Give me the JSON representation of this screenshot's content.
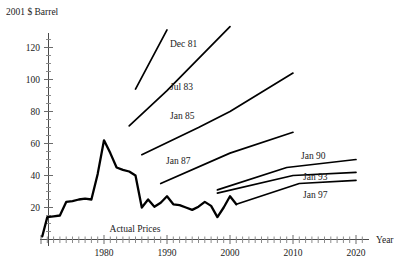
{
  "chart_data": {
    "type": "line",
    "title": "",
    "ylabel": "2001 $ Barrel",
    "xlabel": "Year",
    "xlim": [
      1970,
      2022
    ],
    "ylim": [
      0,
      133
    ],
    "grid": false,
    "legend": "inline-annotations",
    "y_ticks": [
      20,
      40,
      60,
      80,
      100,
      120
    ],
    "x_ticks": [
      1980,
      1990,
      2000,
      2010,
      2020
    ],
    "x_minor_tick_step": 1,
    "series": [
      {
        "name": "Actual Prices",
        "label": "Actual Prices",
        "kind": "history",
        "x": [
          1970.2,
          1971,
          1972,
          1973,
          1974,
          1975,
          1976,
          1977,
          1978,
          1979,
          1980,
          1981,
          1982,
          1983,
          1984,
          1985,
          1986,
          1987,
          1988,
          1989,
          1990,
          1991,
          1992,
          1993,
          1994,
          1995,
          1996,
          1997,
          1998,
          1999,
          2000,
          2001
        ],
        "y": [
          2,
          14,
          14.5,
          15,
          23.5,
          24,
          25,
          25.5,
          25,
          41,
          62,
          54,
          45,
          43.5,
          42.5,
          40,
          20,
          25,
          20.5,
          23,
          27,
          22,
          21.5,
          20,
          18.5,
          20.5,
          23.5,
          21,
          14,
          20,
          27,
          22
        ]
      },
      {
        "name": "Dec 81",
        "label": "Dec  81",
        "kind": "forecast",
        "x": [
          1985,
          1990
        ],
        "y": [
          94,
          131
        ]
      },
      {
        "name": "Jul 83",
        "label": "Jul  83",
        "kind": "forecast",
        "x": [
          1984,
          1990,
          2000
        ],
        "y": [
          71,
          93,
          133
        ]
      },
      {
        "name": "Jan 85",
        "label": "Jan  85",
        "kind": "forecast",
        "x": [
          1986,
          1995,
          2000,
          2010
        ],
        "y": [
          53,
          70,
          80,
          104
        ]
      },
      {
        "name": "Jan 87",
        "label": "Jan  87",
        "kind": "forecast",
        "x": [
          1989,
          2000,
          2010
        ],
        "y": [
          35,
          54,
          67
        ]
      },
      {
        "name": "Jan 90",
        "label": "Jan  90",
        "kind": "forecast",
        "x": [
          1998,
          2009,
          2020
        ],
        "y": [
          31,
          45,
          50
        ]
      },
      {
        "name": "Jan 93",
        "label": "Jan  93",
        "kind": "forecast",
        "x": [
          1998,
          2010,
          2020
        ],
        "y": [
          29,
          40,
          42
        ]
      },
      {
        "name": "Jan 97",
        "label": "Jan  97",
        "kind": "forecast",
        "x": [
          2001,
          2011,
          2020
        ],
        "y": [
          22,
          35,
          37
        ]
      }
    ],
    "annotations": [
      {
        "name": "label-dec-81",
        "text": "Dec  81",
        "x": 170,
        "y": 47
      },
      {
        "name": "label-jul-83",
        "text": "Jul  83",
        "x": 170,
        "y": 90
      },
      {
        "name": "label-jan-85",
        "text": "Jan  85",
        "x": 170,
        "y": 119
      },
      {
        "name": "label-jan-87",
        "text": "Jan  87",
        "x": 166,
        "y": 164
      },
      {
        "name": "label-jan-90",
        "text": "Jan  90",
        "x": 301,
        "y": 159
      },
      {
        "name": "label-jan-93",
        "text": "Jan  93",
        "x": 303,
        "y": 180
      },
      {
        "name": "label-jan-97",
        "text": "Jan  97",
        "x": 303,
        "y": 198
      },
      {
        "name": "label-actual-prices",
        "text": "Actual Prices",
        "x": 135,
        "y": 232
      }
    ]
  },
  "axes": {
    "y_axis_title": "2001 $ Barrel",
    "x_axis_title": "Year",
    "y_tick_labels": [
      "120",
      "100",
      "80",
      "60",
      "40",
      "20"
    ],
    "x_tick_labels": [
      "1980",
      "1990",
      "2000",
      "2010",
      "2020"
    ]
  },
  "colors": {
    "background": "#ffffff",
    "line": "#000000",
    "axis": "#4a4a4a",
    "text": "#222222"
  }
}
